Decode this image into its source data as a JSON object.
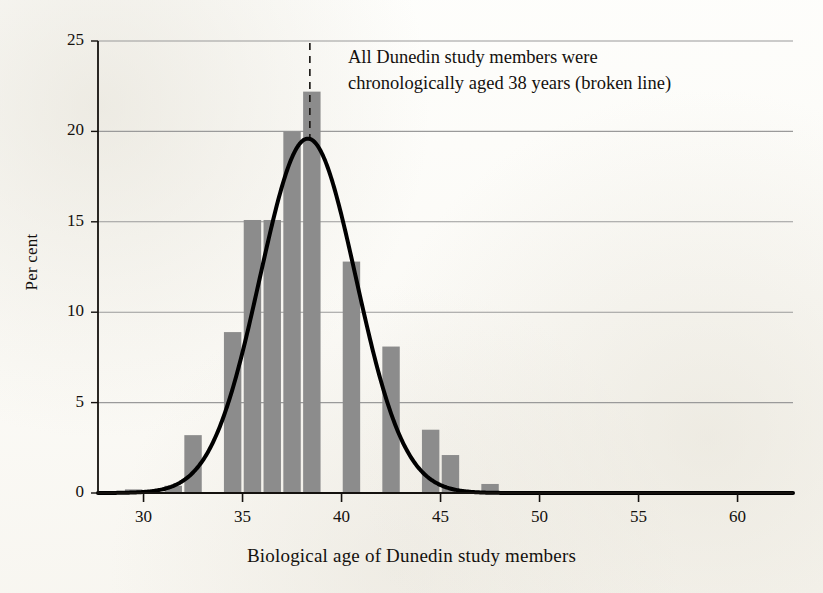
{
  "figure": {
    "background_color": "#fdfdfb",
    "ink_color": "#14110e",
    "bar_color": "#8c8c8c",
    "gridline_color": "#9a9a9a",
    "curve_color": "#000000"
  },
  "annotation": {
    "line1": "All Dunedin study members were",
    "line2": "chronologically aged 38 years (broken line)"
  },
  "chart_data": {
    "type": "bar",
    "title": "",
    "subtitle": "",
    "xlabel": "Biological age of Dunedin study members",
    "ylabel": "Per cent",
    "xlim": [
      27.7,
      62.8
    ],
    "ylim": [
      0,
      25
    ],
    "grid": true,
    "grid_axis": "y",
    "legend": "none",
    "x_tick_labels": [
      "30",
      "35",
      "40",
      "45",
      "50",
      "55",
      "60"
    ],
    "x_tick_values": [
      30,
      35,
      40,
      45,
      50,
      55,
      60
    ],
    "y_tick_labels": [
      "0",
      "5",
      "10",
      "15",
      "20",
      "25"
    ],
    "y_tick_values": [
      0,
      5,
      10,
      15,
      20,
      25
    ],
    "bar_width_years": 0.88,
    "categories": [
      29.5,
      30.5,
      31.5,
      32.5,
      33.5,
      34.5,
      35.5,
      36.5,
      37.5,
      38.5,
      39.5,
      40.5,
      41.5,
      42.5,
      43.5,
      44.5,
      45.5,
      46.5,
      47.5
    ],
    "values": [
      0.2,
      0.0,
      0.4,
      3.2,
      0.0,
      8.9,
      15.1,
      15.1,
      20.0,
      22.2,
      0.0,
      12.8,
      0.0,
      8.1,
      0.0,
      3.5,
      2.1,
      0.0,
      0.5
    ],
    "series": [
      {
        "name": "Per cent of study members",
        "values": [
          0.2,
          0.0,
          0.4,
          3.2,
          0.0,
          8.9,
          15.1,
          15.1,
          20.0,
          22.2,
          0.0,
          12.8,
          0.0,
          8.1,
          0.0,
          3.5,
          2.1,
          0.0,
          0.5
        ]
      }
    ],
    "overlay_curve": {
      "name": "Normal distribution fit",
      "type": "line",
      "mean": 38.3,
      "sigma": 2.43,
      "peak_value": 19.6,
      "style": "solid",
      "width_px": 4
    },
    "reference_line": {
      "name": "Chronological age 38",
      "orientation": "vertical",
      "x": 38.4,
      "style": "dashed",
      "label": "All Dunedin study members were chronologically aged 38 years (broken line)"
    },
    "annotations": [
      "All Dunedin study members were",
      "chronologically aged 38 years (broken line)"
    ]
  }
}
